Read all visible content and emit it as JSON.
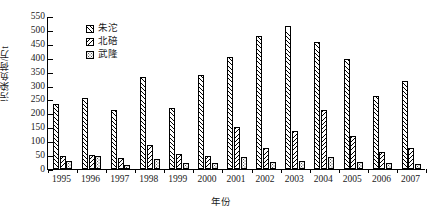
{
  "chart_data": {
    "type": "bar",
    "title": "",
    "xlabel": "年份",
    "ylabel": "污染负荷/万t",
    "ylim": [
      0,
      550
    ],
    "ytick_step": 50,
    "yticks": [
      0,
      50,
      100,
      150,
      200,
      250,
      300,
      350,
      400,
      450,
      500,
      550
    ],
    "grid": false,
    "legend_position": "top-left-inside",
    "categories": [
      "1995",
      "1996",
      "1997",
      "1998",
      "1999",
      "2000",
      "2001",
      "2002",
      "2003",
      "2004",
      "2005",
      "2006",
      "2007"
    ],
    "series": [
      {
        "name": "朱沱",
        "pattern": "forward-diagonal-hatch",
        "values": [
          232,
          257,
          213,
          330,
          218,
          337,
          402,
          478,
          515,
          455,
          395,
          262,
          318
        ]
      },
      {
        "name": "北碚",
        "pattern": "backward-diagonal-hatch",
        "values": [
          45,
          50,
          38,
          85,
          55,
          48,
          150,
          75,
          135,
          212,
          118,
          60,
          75
        ]
      },
      {
        "name": "武隆",
        "pattern": "dotted-stipple",
        "values": [
          30,
          45,
          15,
          35,
          20,
          22,
          42,
          25,
          30,
          42,
          25,
          20,
          18
        ]
      }
    ],
    "colors": {
      "axis": "#000000",
      "bar_outline": "#000000",
      "bar_fill": "#ffffff",
      "text": "#1a1a1a"
    }
  }
}
